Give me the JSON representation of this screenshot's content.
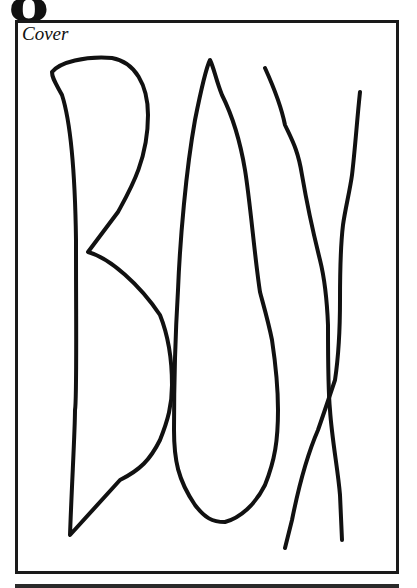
{
  "page": {
    "number": "8",
    "figure_label": "Cover",
    "drawing_text": "BOX",
    "stroke_color": "#111111",
    "border_color": "#1a1a1a"
  }
}
